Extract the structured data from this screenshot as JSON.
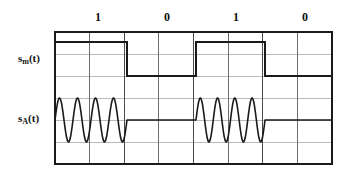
{
  "figure": {
    "bit_labels": [
      {
        "text": "1",
        "x_center": 98
      },
      {
        "text": "0",
        "x_center": 167
      },
      {
        "text": "1",
        "x_center": 236
      },
      {
        "text": "0",
        "x_center": 305
      }
    ],
    "signal_labels": [
      {
        "name": "s_m(t)",
        "base": "s",
        "sub": "m",
        "suffix": "(t)",
        "x": 18,
        "y": 52
      },
      {
        "name": "s_A(t)",
        "base": "s",
        "sub": "A",
        "suffix": "(t)",
        "x": 18,
        "y": 112
      }
    ],
    "grid": {
      "left": 55,
      "right": 332,
      "top": 32,
      "bottom": 164,
      "columns": 8,
      "rows": 6,
      "border_color": "#1a1a1a",
      "border_width": 2,
      "minor_color": "#b9b9b9",
      "major_color": "#4a4a4a"
    },
    "waveforms": {
      "digital": {
        "name": "s_m(t)",
        "color": "#1a1a1a",
        "line_width": 2,
        "bits": [
          1,
          0,
          1,
          0
        ],
        "high_y": 42,
        "low_y": 76,
        "bit_edges": [
          55,
          127,
          196,
          265,
          332
        ]
      },
      "ask": {
        "name": "s_A(t)",
        "color": "#1a1a1a",
        "line_width": 1.6,
        "baseline_y": 120,
        "amplitude": 22,
        "cycles_per_bit": 4,
        "bursts": [
          {
            "start": 55,
            "end": 127
          },
          {
            "start": 196,
            "end": 265
          }
        ],
        "flat_segments": [
          {
            "start": 127,
            "end": 196
          },
          {
            "start": 265,
            "end": 332
          }
        ]
      }
    }
  }
}
